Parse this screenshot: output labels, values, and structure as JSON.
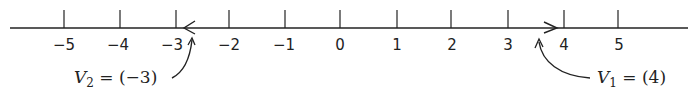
{
  "number_line": {
    "min": -5,
    "max": 5,
    "ticks": [
      -5,
      -4,
      -3,
      -2,
      -1,
      0,
      1,
      2,
      3,
      4,
      5
    ],
    "tick_labels": [
      "−5",
      "−4",
      "−3",
      "−2",
      "−1",
      "0",
      "1",
      "2",
      "3",
      "4",
      "5"
    ]
  },
  "vectors": [
    {
      "name": "V1",
      "symbol": "V",
      "subscript": "1",
      "equals": " = ",
      "value_text": "(4)",
      "value": 4,
      "direction": "right"
    },
    {
      "name": "V2",
      "symbol": "V",
      "subscript": "2",
      "equals": " = ",
      "value_text": "(−3)",
      "value": -3,
      "direction": "left"
    }
  ],
  "colors": {
    "ink": "#222222",
    "background": "#ffffff"
  }
}
